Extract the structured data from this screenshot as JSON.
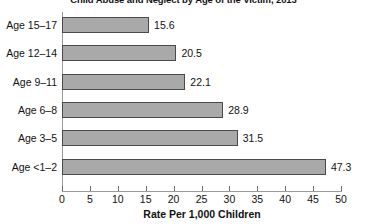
{
  "chart_data": {
    "type": "bar",
    "orientation": "horizontal",
    "title": "Child Abuse and Neglect by Age of the Victim, 2013",
    "categories": [
      "Age 15–17",
      "Age 12–14",
      "Age 9–11",
      "Age 6–8",
      "Age 3–5",
      "Age <1–2"
    ],
    "values": [
      15.6,
      20.5,
      22.1,
      28.9,
      31.5,
      47.3
    ],
    "value_labels": [
      "15.6",
      "20.5",
      "22.1",
      "28.9",
      "31.5",
      "47.3"
    ],
    "xlabel": "Rate Per 1,000 Children",
    "ylabel": "",
    "xlim": [
      0,
      50
    ],
    "xticks": [
      0,
      5,
      10,
      15,
      20,
      25,
      30,
      35,
      40,
      45,
      50
    ],
    "xtick_labels": [
      "0",
      "5",
      "10",
      "15",
      "20",
      "25",
      "30",
      "35",
      "40",
      "45",
      "50"
    ],
    "grid": false,
    "legend": false,
    "bar_color": "#a9a9a9",
    "bar_border_color": "#4a4a4a",
    "axis_color": "#9a9a9a",
    "background": "#ffffff"
  }
}
